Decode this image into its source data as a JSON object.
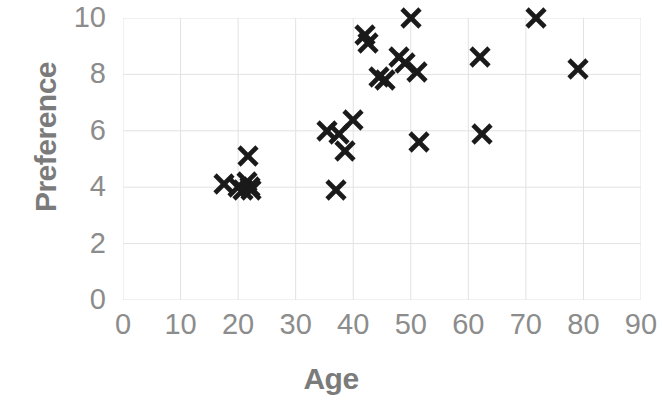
{
  "chart_data": {
    "type": "scatter",
    "title": "",
    "xlabel": "Age",
    "ylabel": "Preference",
    "xlim": [
      0,
      90
    ],
    "ylim": [
      0,
      10
    ],
    "xticks": [
      0,
      10,
      20,
      30,
      40,
      50,
      60,
      70,
      80,
      90
    ],
    "yticks": [
      0,
      2,
      4,
      6,
      8,
      10
    ],
    "xtick_labels": [
      "0",
      "10",
      "20",
      "30",
      "40",
      "50",
      "60",
      "70",
      "80",
      "90"
    ],
    "ytick_labels": [
      "0",
      "2",
      "4",
      "6",
      "8",
      "10"
    ],
    "grid": true,
    "legend": false,
    "marker": "x",
    "marker_color": "#1a1a1a",
    "grid_color": "#e2e2e2",
    "axis_label_color": "#7b7b7b",
    "tick_label_color": "#8c8c8c",
    "series": [
      {
        "name": "Preference vs Age",
        "points": [
          {
            "x": 17.5,
            "y": 4.1
          },
          {
            "x": 20.0,
            "y": 4.0
          },
          {
            "x": 20.8,
            "y": 3.9
          },
          {
            "x": 21.5,
            "y": 4.2
          },
          {
            "x": 21.8,
            "y": 5.1
          },
          {
            "x": 22.0,
            "y": 4.0
          },
          {
            "x": 22.3,
            "y": 3.9
          },
          {
            "x": 35.5,
            "y": 6.0
          },
          {
            "x": 37.0,
            "y": 3.9
          },
          {
            "x": 37.5,
            "y": 5.9
          },
          {
            "x": 38.5,
            "y": 5.3
          },
          {
            "x": 40.0,
            "y": 6.4
          },
          {
            "x": 42.0,
            "y": 9.4
          },
          {
            "x": 42.5,
            "y": 9.1
          },
          {
            "x": 44.5,
            "y": 7.9
          },
          {
            "x": 45.5,
            "y": 7.8
          },
          {
            "x": 48.0,
            "y": 8.6
          },
          {
            "x": 49.0,
            "y": 8.4
          },
          {
            "x": 50.0,
            "y": 10.0
          },
          {
            "x": 51.0,
            "y": 8.1
          },
          {
            "x": 51.5,
            "y": 5.6
          },
          {
            "x": 62.0,
            "y": 8.6
          },
          {
            "x": 62.3,
            "y": 5.9
          },
          {
            "x": 71.7,
            "y": 10.0
          },
          {
            "x": 79.0,
            "y": 8.2
          }
        ]
      }
    ]
  }
}
